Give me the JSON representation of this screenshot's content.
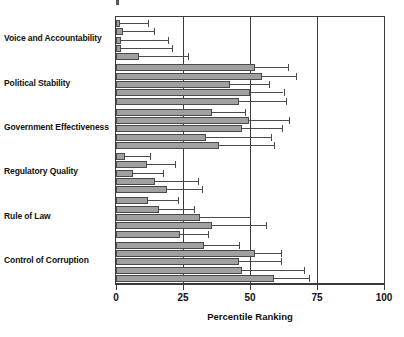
{
  "chart_data": {
    "type": "bar",
    "orientation": "horizontal",
    "title": "",
    "subtitle": "",
    "xlabel": "Percentile Ranking",
    "ylabel": "",
    "xlim": [
      0,
      100
    ],
    "xticks": [
      0,
      25,
      50,
      75,
      100
    ],
    "xtick_labels": [
      "0",
      "25",
      "50",
      "75",
      "100"
    ],
    "grid": true,
    "gridlines_at": [
      25,
      50,
      75
    ],
    "legend": null,
    "legend_position": "none",
    "categories": [
      "Voice and Accountability",
      "Political Stability",
      "Government Effectiveness",
      "Regulatory Quality",
      "Rule of Law",
      "Control of Corruption"
    ],
    "bars_per_category": 5,
    "note": "Each category shows 5 bars (successive survey periods, top to bottom) with horizontal error bars for the 90% confidence interval.",
    "groups": [
      {
        "category": "Voice and Accountability",
        "bars": [
          {
            "value": 1.5,
            "err_low": 0.0,
            "err_high": 12.0
          },
          {
            "value": 2.5,
            "err_low": 0.0,
            "err_high": 14.0
          },
          {
            "value": 2.0,
            "err_low": 0.0,
            "err_high": 19.5
          },
          {
            "value": 2.0,
            "err_low": 0.0,
            "err_high": 21.0
          },
          {
            "value": 8.5,
            "err_low": 0.0,
            "err_high": 27.0
          }
        ]
      },
      {
        "category": "Political Stability",
        "bars": [
          {
            "value": 52.0,
            "err_low": 41.0,
            "err_high": 64.0
          },
          {
            "value": 54.5,
            "err_low": 44.0,
            "err_high": 67.0
          },
          {
            "value": 42.5,
            "err_low": 29.5,
            "err_high": 57.0
          },
          {
            "value": 50.0,
            "err_low": 32.5,
            "err_high": 62.5
          },
          {
            "value": 46.0,
            "err_low": 27.0,
            "err_high": 63.5
          }
        ]
      },
      {
        "category": "Government Effectiveness",
        "bars": [
          {
            "value": 36.0,
            "err_low": 24.0,
            "err_high": 48.0
          },
          {
            "value": 49.5,
            "err_low": 31.5,
            "err_high": 64.5
          },
          {
            "value": 47.0,
            "err_low": 30.5,
            "err_high": 62.0
          },
          {
            "value": 33.5,
            "err_low": 12.0,
            "err_high": 58.0
          },
          {
            "value": 38.5,
            "err_low": 16.5,
            "err_high": 59.0
          }
        ]
      },
      {
        "category": "Regulatory Quality",
        "bars": [
          {
            "value": 3.5,
            "err_low": 0.0,
            "err_high": 12.5
          },
          {
            "value": 11.5,
            "err_low": 0.0,
            "err_high": 22.0
          },
          {
            "value": 6.5,
            "err_low": 0.0,
            "err_high": 17.5
          },
          {
            "value": 14.5,
            "err_low": 0.0,
            "err_high": 30.5
          },
          {
            "value": 19.0,
            "err_low": 9.0,
            "err_high": 32.0
          }
        ]
      },
      {
        "category": "Rule of Law",
        "bars": [
          {
            "value": 12.0,
            "err_low": 4.5,
            "err_high": 23.0
          },
          {
            "value": 16.0,
            "err_low": 9.5,
            "err_high": 29.0
          },
          {
            "value": 31.5,
            "err_low": 12.0,
            "err_high": 50.0
          },
          {
            "value": 36.0,
            "err_low": 18.0,
            "err_high": 56.0
          },
          {
            "value": 24.0,
            "err_low": 15.0,
            "err_high": 34.5
          }
        ]
      },
      {
        "category": "Control of Corruption",
        "bars": [
          {
            "value": 33.0,
            "err_low": 19.5,
            "err_high": 46.0
          },
          {
            "value": 52.0,
            "err_low": 41.0,
            "err_high": 61.5
          },
          {
            "value": 46.0,
            "err_low": 28.0,
            "err_high": 61.5
          },
          {
            "value": 47.0,
            "err_low": 23.0,
            "err_high": 70.0
          },
          {
            "value": 59.0,
            "err_low": 39.0,
            "err_high": 72.0
          }
        ]
      }
    ]
  },
  "style": {
    "bar_fill": "#a0a0a0",
    "bar_stroke": "#4a4a4a",
    "axis_color": "#3a3a3a",
    "grid_color": "#3a3a3a",
    "text_color": "#111111",
    "background": "#ffffff"
  }
}
